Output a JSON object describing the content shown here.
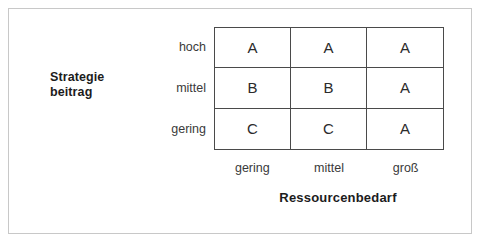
{
  "chart_data": {
    "type": "table",
    "title": "",
    "xlabel": "Ressourcenbedarf",
    "ylabel": "Strategie beitrag",
    "ylabel_lines": [
      "Strategie",
      "beitrag"
    ],
    "categories": [
      "gering",
      "mittel",
      "groß"
    ],
    "row_categories": [
      "hoch",
      "mittel",
      "gering"
    ],
    "rows": [
      {
        "label": "hoch",
        "values": [
          "A",
          "A",
          "A"
        ]
      },
      {
        "label": "mittel",
        "values": [
          "B",
          "B",
          "A"
        ]
      },
      {
        "label": "gering",
        "values": [
          "C",
          "C",
          "A"
        ]
      }
    ],
    "grid": true,
    "legend": null,
    "colors": {
      "frame": "#c8c8c8",
      "grid_line": "#4a4a4a",
      "cell_text": "#2b2b2b",
      "tick_text": "#3a3a3a",
      "axis_title": "#1c1c1c",
      "background": "#ffffff"
    }
  }
}
